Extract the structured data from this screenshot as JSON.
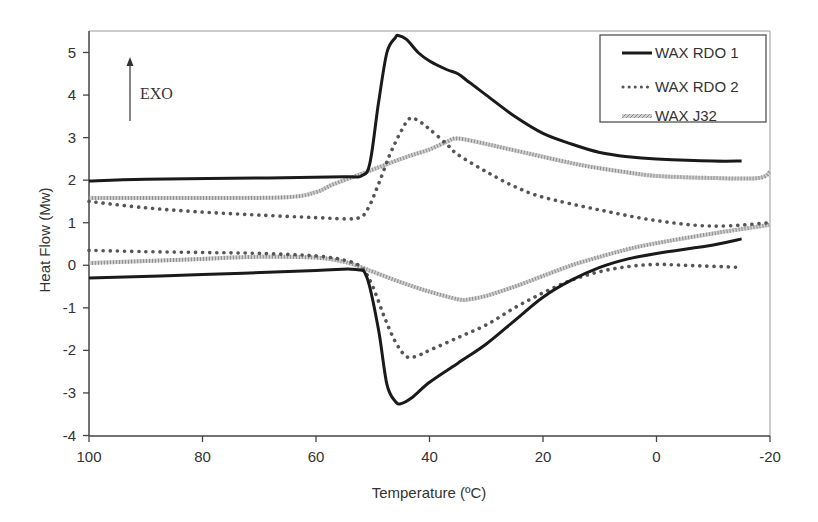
{
  "chart_data": {
    "type": "line",
    "title": "",
    "xlabel": "Temperature (ºC)",
    "ylabel": "Heat Flow (Mw)",
    "xlim": [
      100,
      -20
    ],
    "ylim": [
      -4,
      5.5
    ],
    "x_ticks": [
      100,
      80,
      60,
      40,
      20,
      0,
      -20
    ],
    "y_ticks": [
      -4,
      -3,
      -2,
      -1,
      0,
      1,
      2,
      3,
      4,
      5
    ],
    "grid": false,
    "legend_position": "top-right",
    "annotation": {
      "text": "EXO",
      "arrow": "up"
    },
    "series": [
      {
        "name": "WAX RDO 1",
        "style": "solid",
        "color": "#1a1a1a",
        "segments": [
          {
            "label": "cooling (exotherm)",
            "x": [
              100,
              90,
              70,
              55,
              52,
              50.5,
              49,
              47.5,
              46,
              45.5,
              44,
              42,
              40,
              37,
              35,
              33,
              30,
              25,
              20,
              15,
              10,
              5,
              0,
              -10,
              -15
            ],
            "y": [
              1.98,
              2.02,
              2.05,
              2.08,
              2.1,
              2.4,
              3.8,
              5.0,
              5.35,
              5.4,
              5.3,
              5.0,
              4.8,
              4.6,
              4.5,
              4.3,
              4.0,
              3.5,
              3.1,
              2.85,
              2.65,
              2.55,
              2.5,
              2.45,
              2.45
            ]
          },
          {
            "label": "heating (endotherm)",
            "x": [
              100,
              80,
              60,
              53,
              51,
              49,
              47.5,
              46,
              45,
              43,
              40,
              35,
              30,
              25,
              20,
              15,
              10,
              5,
              0,
              -10,
              -15
            ],
            "y": [
              -0.3,
              -0.22,
              -0.12,
              -0.1,
              -0.3,
              -1.5,
              -2.8,
              -3.2,
              -3.25,
              -3.1,
              -2.75,
              -2.3,
              -1.85,
              -1.3,
              -0.75,
              -0.35,
              -0.05,
              0.15,
              0.28,
              0.48,
              0.62
            ]
          }
        ]
      },
      {
        "name": "WAX RDO 2",
        "style": "dotted",
        "color": "#555555",
        "segments": [
          {
            "label": "cooling (exotherm)",
            "x": [
              100,
              90,
              80,
              70,
              60,
              53,
              51,
              49,
              47,
              45,
              43.5,
              42,
              40,
              37,
              35,
              30,
              25,
              20,
              10,
              0,
              -10,
              -20
            ],
            "y": [
              1.5,
              1.35,
              1.25,
              1.18,
              1.12,
              1.1,
              1.3,
              1.9,
              2.6,
              3.15,
              3.45,
              3.4,
              3.2,
              2.85,
              2.6,
              2.2,
              1.85,
              1.6,
              1.3,
              1.05,
              0.92,
              1.0
            ]
          },
          {
            "label": "heating (endotherm)",
            "x": [
              100,
              90,
              80,
              70,
              60,
              55,
              52,
              50,
              48,
              46,
              44,
              42,
              40,
              35,
              30,
              25,
              20,
              15,
              10,
              5,
              0,
              -5,
              -15
            ],
            "y": [
              0.35,
              0.32,
              0.3,
              0.28,
              0.22,
              0.12,
              -0.05,
              -0.5,
              -1.2,
              -1.8,
              -2.15,
              -2.12,
              -2.0,
              -1.7,
              -1.4,
              -1.0,
              -0.65,
              -0.35,
              -0.15,
              -0.03,
              0.02,
              0.0,
              -0.05
            ]
          }
        ]
      },
      {
        "name": "WAX J32",
        "style": "hatched-gray",
        "color": "#aaaaaa",
        "segments": [
          {
            "label": "cooling (exotherm)",
            "x": [
              100,
              80,
              65,
              60,
              57,
              52,
              48,
              44,
              40,
              37,
              35,
              30,
              25,
              20,
              15,
              10,
              5,
              0,
              -10,
              -18,
              -20
            ],
            "y": [
              1.58,
              1.58,
              1.6,
              1.72,
              1.9,
              2.15,
              2.35,
              2.55,
              2.72,
              2.9,
              2.98,
              2.85,
              2.7,
              2.55,
              2.4,
              2.28,
              2.18,
              2.1,
              2.05,
              2.05,
              2.2
            ]
          },
          {
            "label": "heating (endotherm)",
            "x": [
              100,
              90,
              80,
              70,
              60,
              55,
              52,
              50,
              45,
              40,
              35,
              33,
              30,
              25,
              20,
              15,
              10,
              5,
              0,
              -10,
              -20
            ],
            "y": [
              0.05,
              0.1,
              0.15,
              0.2,
              0.18,
              0.08,
              -0.05,
              -0.15,
              -0.4,
              -0.62,
              -0.8,
              -0.8,
              -0.72,
              -0.5,
              -0.25,
              0.0,
              0.2,
              0.38,
              0.52,
              0.75,
              0.95
            ]
          }
        ]
      }
    ]
  },
  "labels": {
    "xlabel": "Temperature (ºC)",
    "ylabel": "Heat Flow (Mw)",
    "exo": "EXO",
    "legend": [
      "WAX RDO 1",
      "WAX RDO 2",
      "WAX J32"
    ],
    "x_ticks": [
      "100",
      "80",
      "60",
      "40",
      "20",
      "0",
      "-20"
    ],
    "y_ticks": [
      "5",
      "4",
      "3",
      "2",
      "1",
      "0",
      "-1",
      "-2",
      "-3",
      "-4"
    ]
  }
}
